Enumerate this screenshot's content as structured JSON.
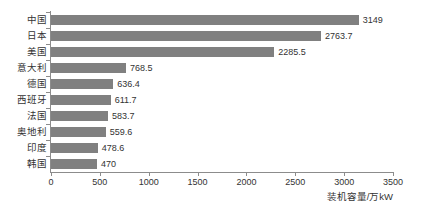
{
  "chart_data": {
    "type": "bar",
    "orientation": "horizontal",
    "title": "",
    "xlabel": "装机容量/万kW",
    "ylabel": "",
    "xlim": [
      0,
      3500
    ],
    "xticks": [
      0,
      500,
      1000,
      1500,
      2000,
      2500,
      3000,
      3500
    ],
    "xtick_labels": [
      "0",
      "500",
      "1000",
      "1500",
      "2000",
      "2500",
      "3000",
      "3500"
    ],
    "grid": false,
    "legend": false,
    "bar_color": "#808080",
    "axis_color": "#8c8c8c",
    "text_color": "#333333",
    "categories": [
      "中国",
      "日本",
      "美国",
      "意大利",
      "德国",
      "西班牙",
      "法国",
      "奥地利",
      "印度",
      "韩国"
    ],
    "values": [
      3149,
      2763.7,
      2285.5,
      768.5,
      636.4,
      611.7,
      583.7,
      559.6,
      478.6,
      470
    ],
    "value_labels": [
      "3149",
      "2763.7",
      "2285.5",
      "768.5",
      "636.4",
      "611.7",
      "583.7",
      "559.6",
      "478.6",
      "470"
    ]
  }
}
